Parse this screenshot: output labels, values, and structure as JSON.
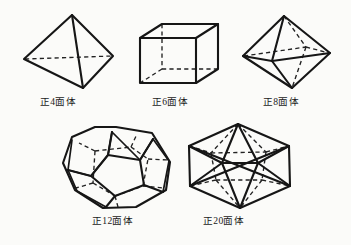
{
  "figure": {
    "background_color": "#fbfbf9",
    "line_color": "#161616",
    "hidden_line_style": "dashed",
    "rows": [
      {
        "solids": [
          "tetrahedron",
          "hexahedron",
          "octahedron"
        ]
      },
      {
        "solids": [
          "dodecahedron",
          "icosahedron"
        ]
      }
    ],
    "solids": [
      {
        "id": "tetrahedron",
        "label": "正4面体",
        "faces": 4,
        "label_x": 40,
        "label_y": 97
      },
      {
        "id": "hexahedron",
        "label": "正6面体",
        "faces": 6,
        "label_x": 152,
        "label_y": 97
      },
      {
        "id": "octahedron",
        "label": "正8面体",
        "faces": 8,
        "label_x": 263,
        "label_y": 97
      },
      {
        "id": "dodecahedron",
        "label": "正12面体",
        "faces": 12,
        "label_x": 92,
        "label_y": 216
      },
      {
        "id": "icosahedron",
        "label": "正20面体",
        "faces": 20,
        "label_x": 203,
        "label_y": 216
      }
    ]
  }
}
